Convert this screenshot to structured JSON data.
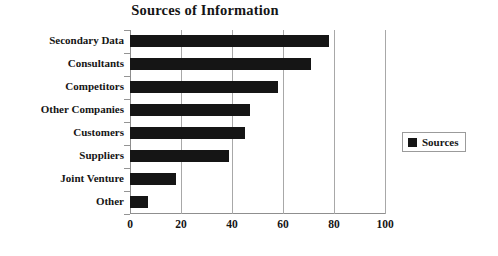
{
  "chart_data": {
    "type": "bar",
    "orientation": "horizontal",
    "title": "Sources of Information",
    "xlabel": "",
    "ylabel": "",
    "categories": [
      "Secondary Data",
      "Consultants",
      "Competitors",
      "Other Companies",
      "Customers",
      "Suppliers",
      "Joint Venture",
      "Other"
    ],
    "values": [
      78,
      71,
      58,
      47,
      45,
      39,
      18,
      7
    ],
    "series": [
      {
        "name": "Sources",
        "values": [
          78,
          71,
          58,
          47,
          45,
          39,
          18,
          7
        ]
      }
    ],
    "xlim": [
      0,
      100
    ],
    "xticks": [
      0,
      20,
      40,
      60,
      80,
      100
    ],
    "xtick_labels": [
      "0",
      "20",
      "40",
      "60",
      "80",
      "100"
    ],
    "grid": true,
    "grid_axis": "x",
    "legend": {
      "position": "right",
      "entries": [
        {
          "label": "Sources",
          "color": "#151515",
          "marker": "legend-swatch-square"
        }
      ]
    },
    "colors": {
      "bar": "#151515",
      "grid": "#a8a8a8",
      "axis": "#8d8d8d",
      "text": "#151515",
      "background": "#ffffff"
    }
  }
}
